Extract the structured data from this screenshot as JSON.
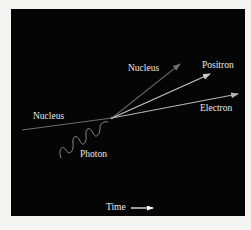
{
  "diagram": {
    "labels": {
      "nucleus_incoming": "Nucleus",
      "nucleus_outgoing": "Nucleus",
      "positron": "Positron",
      "electron": "Electron",
      "photon": "Photon",
      "time": "Time"
    },
    "colors": {
      "background": "#050505",
      "frame": "#f4f4f2",
      "text": "#e8e8e8",
      "nucleus_track": "#6e6e6e",
      "positron_track": "#c8c8c8",
      "electron_track": "#b4b4b4",
      "photon_wave": "#8a8a8a",
      "time_arrow": "#ffffff"
    },
    "vertex": {
      "x": 112,
      "y": 118
    },
    "tracks": [
      {
        "name": "nucleus-incoming",
        "from": [
          22,
          130
        ],
        "to": [
          112,
          118
        ],
        "arrow": false
      },
      {
        "name": "nucleus-outgoing",
        "from": [
          112,
          118
        ],
        "to": [
          180,
          64
        ],
        "arrow": true
      },
      {
        "name": "positron",
        "from": [
          112,
          118
        ],
        "to": [
          210,
          74
        ],
        "arrow": true
      },
      {
        "name": "electron",
        "from": [
          112,
          118
        ],
        "to": [
          238,
          94
        ],
        "arrow": true
      },
      {
        "name": "photon",
        "from": [
          62,
          158
        ],
        "to": [
          108,
          122
        ],
        "wavy": true
      }
    ]
  }
}
